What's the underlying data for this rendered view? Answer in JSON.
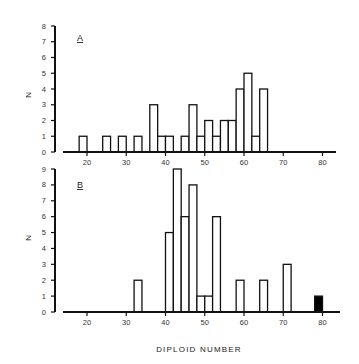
{
  "chart_data": [
    {
      "type": "bar",
      "panel": "A",
      "title": "",
      "xlabel": "",
      "ylabel": "N",
      "xlim": [
        14,
        86
      ],
      "ylim": [
        0,
        8
      ],
      "yticks": [
        0,
        1,
        2,
        3,
        4,
        5,
        6,
        7,
        8
      ],
      "xticks": [
        20,
        30,
        40,
        50,
        60,
        70,
        80
      ],
      "bin_width": 2,
      "grid": false,
      "bins": [
        {
          "start": 18,
          "end": 20,
          "value": 1,
          "filled": false
        },
        {
          "start": 24,
          "end": 26,
          "value": 1,
          "filled": false
        },
        {
          "start": 28,
          "end": 30,
          "value": 1,
          "filled": false
        },
        {
          "start": 32,
          "end": 34,
          "value": 1,
          "filled": false
        },
        {
          "start": 36,
          "end": 38,
          "value": 3,
          "filled": false
        },
        {
          "start": 38,
          "end": 40,
          "value": 1,
          "filled": false
        },
        {
          "start": 40,
          "end": 42,
          "value": 1,
          "filled": false
        },
        {
          "start": 44,
          "end": 46,
          "value": 1,
          "filled": false
        },
        {
          "start": 46,
          "end": 48,
          "value": 3,
          "filled": false
        },
        {
          "start": 48,
          "end": 50,
          "value": 1,
          "filled": false
        },
        {
          "start": 50,
          "end": 52,
          "value": 2,
          "filled": false
        },
        {
          "start": 52,
          "end": 54,
          "value": 1,
          "filled": false
        },
        {
          "start": 54,
          "end": 56,
          "value": 2,
          "filled": false
        },
        {
          "start": 56,
          "end": 58,
          "value": 2,
          "filled": false
        },
        {
          "start": 58,
          "end": 60,
          "value": 4,
          "filled": false
        },
        {
          "start": 60,
          "end": 62,
          "value": 5,
          "filled": false
        },
        {
          "start": 62,
          "end": 64,
          "value": 1,
          "filled": false
        },
        {
          "start": 64,
          "end": 66,
          "value": 4,
          "filled": false
        }
      ]
    },
    {
      "type": "bar",
      "panel": "B",
      "title": "",
      "xlabel": "DIPLOID NUMBER",
      "ylabel": "N",
      "xlim": [
        14,
        86
      ],
      "ylim": [
        0,
        9
      ],
      "yticks": [
        0,
        1,
        2,
        3,
        4,
        5,
        6,
        7,
        8,
        9
      ],
      "xticks": [
        20,
        30,
        40,
        50,
        60,
        70,
        80
      ],
      "bin_width": 2,
      "grid": false,
      "bins": [
        {
          "start": 32,
          "end": 34,
          "value": 2,
          "filled": false
        },
        {
          "start": 40,
          "end": 42,
          "value": 5,
          "filled": false
        },
        {
          "start": 42,
          "end": 44,
          "value": 9,
          "filled": false
        },
        {
          "start": 44,
          "end": 46,
          "value": 6,
          "filled": false
        },
        {
          "start": 46,
          "end": 48,
          "value": 8,
          "filled": false
        },
        {
          "start": 48,
          "end": 50,
          "value": 1,
          "filled": false
        },
        {
          "start": 50,
          "end": 52,
          "value": 1,
          "filled": false
        },
        {
          "start": 52,
          "end": 54,
          "value": 6,
          "filled": false
        },
        {
          "start": 58,
          "end": 60,
          "value": 2,
          "filled": false
        },
        {
          "start": 64,
          "end": 66,
          "value": 2,
          "filled": false
        },
        {
          "start": 70,
          "end": 72,
          "value": 3,
          "filled": false
        },
        {
          "start": 78,
          "end": 80,
          "value": 1,
          "filled": true
        }
      ]
    }
  ],
  "labels": {
    "panel_a": "A",
    "panel_b": "B",
    "y_axis_a": "N",
    "y_axis_b": "N",
    "x_axis_title": "DIPLOID NUMBER"
  },
  "colors": {
    "bar_fill": "#ffffff",
    "bar_fill_highlight": "#000000",
    "stroke": "#111111"
  }
}
